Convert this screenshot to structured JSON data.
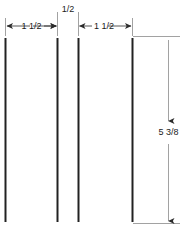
{
  "drawing": {
    "title": "Slat spacing dimension drawing",
    "units": "inches",
    "stroke_color": "#222222",
    "dimension_line_color": "#999999",
    "background": "#ffffff",
    "horizontal_dimensions": [
      {
        "id": "dim-1",
        "label": "1  1/2",
        "from_line": 1,
        "to_line": 2,
        "arrow_style": "inside"
      },
      {
        "id": "dim-2",
        "label": "1/2",
        "from_line": 2,
        "to_line": 3,
        "arrow_style": "outside"
      },
      {
        "id": "dim-3",
        "label": "1  1/2",
        "from_line": 3,
        "to_line": 4,
        "arrow_style": "inside"
      }
    ],
    "vertical_dimensions": [
      {
        "id": "dim-4",
        "label": "5  3/8",
        "measures": "slat-height",
        "arrow_style": "inside"
      }
    ],
    "slats": [
      {
        "id": "slat-1",
        "x": 5
      },
      {
        "id": "slat-2",
        "x": 57
      },
      {
        "id": "slat-3",
        "x": 78
      },
      {
        "id": "slat-4",
        "x": 132
      }
    ],
    "geometry": {
      "slat_top_y": 38,
      "slat_bottom_y": 222,
      "dim_line_y": 26,
      "vert_dim_x": 168,
      "vert_dim_top_y": 38,
      "vert_dim_bottom_y": 222
    }
  }
}
